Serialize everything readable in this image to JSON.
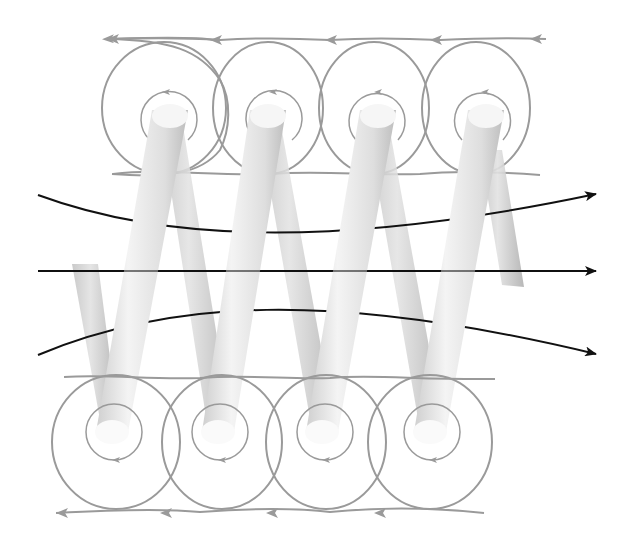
{
  "diagram": {
    "title": "",
    "labels": [],
    "colors": {
      "background": "#ffffff",
      "wire_light": "#f2f2f2",
      "wire_mid": "#d8d8d8",
      "wire_dark": "#b8b8b8",
      "local_field_lines": "#9a9a9a",
      "interior_field_lines": "#111111"
    },
    "coil": {
      "turns": 4,
      "top_ends": [
        [
          170,
          125
        ],
        [
          266,
          125
        ],
        [
          376,
          125
        ],
        [
          484,
          125
        ]
      ],
      "bottom_ends": [
        [
          110,
          420
        ],
        [
          216,
          420
        ],
        [
          320,
          420
        ],
        [
          428,
          420
        ]
      ],
      "lead_in": [
        [
          80,
          268
        ],
        [
          110,
          420
        ]
      ],
      "lead_out": [
        [
          490,
          150
        ],
        [
          512,
          283
        ]
      ]
    },
    "interior_field_lines": [
      {
        "name": "upper",
        "direction": "right",
        "path": "M38,195 C160,240 330,250 596,194"
      },
      {
        "name": "middle",
        "direction": "right",
        "path": "M38,271 L596,271"
      },
      {
        "name": "lower",
        "direction": "right",
        "path": "M38,355 C170,300 330,290 596,354"
      }
    ],
    "local_field_loops": {
      "top_row": {
        "count": 4,
        "arrow_direction": "left",
        "centers_x": [
          164,
          264,
          364,
          472
        ],
        "center_y": 110
      },
      "bottom_row": {
        "count": 4,
        "arrow_direction": "left",
        "centers_x": [
          117,
          222,
          328,
          432
        ],
        "center_y": 440
      }
    }
  }
}
